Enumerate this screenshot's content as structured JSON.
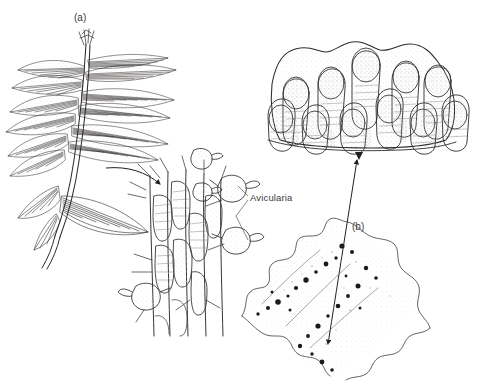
{
  "figure": {
    "kind": "scientific-line-illustration",
    "background_color": "#ffffff",
    "ink_color": "#231f20",
    "stipple_color": "#b9b9b9",
    "panels": [
      {
        "id": "a",
        "label": "(a)",
        "description": "branching feather-like bryozoan colony with fan-shaped frond clusters"
      },
      {
        "id": "b",
        "label": "(b)",
        "description": "whole encrusting colony with lobed margin and dark spots"
      }
    ],
    "callouts": [
      {
        "id": "zooid-detail",
        "description": "enlarged branch showing rows of zooids bearing bird's-head avicularia"
      },
      {
        "id": "surface-detail",
        "description": "enlarged colony surface showing finger-like lobes with rounded tips"
      }
    ],
    "annotations": [
      {
        "id": "avicularia",
        "text": "Avicularia",
        "leader_lines": 2
      }
    ],
    "arrows": [
      {
        "id": "colony-to-zooid",
        "style": "curved",
        "heads": 1
      },
      {
        "id": "colony-to-surface",
        "style": "straight-diagonal",
        "heads": 2
      }
    ],
    "caption": {
      "text": "",
      "truncated": true
    }
  }
}
